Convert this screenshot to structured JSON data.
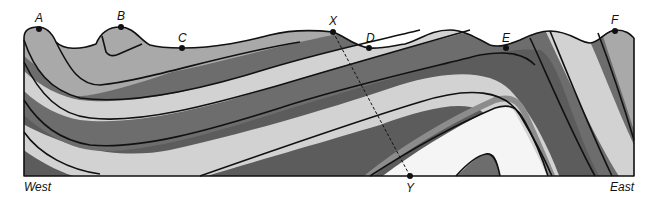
{
  "diagram": {
    "type": "folded-strata-cross-section",
    "points": [
      {
        "id": "A",
        "label": "A"
      },
      {
        "id": "B",
        "label": "B"
      },
      {
        "id": "C",
        "label": "C"
      },
      {
        "id": "X",
        "label": "X"
      },
      {
        "id": "D",
        "label": "D"
      },
      {
        "id": "E",
        "label": "E"
      },
      {
        "id": "F",
        "label": "F"
      },
      {
        "id": "Y",
        "label": "Y"
      }
    ],
    "directions": {
      "west": "West",
      "east": "East"
    },
    "section_line": {
      "from": "X",
      "to": "Y",
      "style": "dashed"
    },
    "layer_colors": {
      "white": "#f5f5f5",
      "light": "#d2d2d2",
      "mid": "#a9a9a9",
      "medium": "#8c8c8c",
      "dark": "#6d6d6d",
      "darkest": "#5c5c5c"
    }
  }
}
